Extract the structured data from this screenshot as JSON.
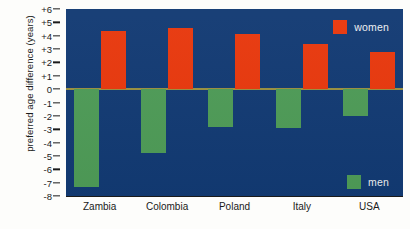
{
  "chart_data": {
    "type": "bar",
    "title": "",
    "subtitle": "",
    "xlabel": "",
    "ylabel": "preferred age difference (years)",
    "categories": [
      "Zambia",
      "Colombia",
      "Poland",
      "Italy",
      "USA"
    ],
    "series": [
      {
        "name": "women",
        "color": "#e8380d",
        "values": [
          4.35,
          4.6,
          4.1,
          3.4,
          2.8
        ]
      },
      {
        "name": "men",
        "color": "#4e9b57",
        "values": [
          -7.3,
          -4.8,
          -2.8,
          -2.9,
          -2.0
        ]
      }
    ],
    "ylim": [
      -8,
      6
    ],
    "ytick_labels": [
      "+6",
      "+5",
      "+4",
      "+3",
      "+2",
      "+1",
      "0",
      "-1",
      "-2",
      "-3",
      "-4",
      "-5",
      "-6",
      "-7",
      "-8"
    ],
    "ytick_values": [
      6,
      5,
      4,
      3,
      2,
      1,
      0,
      -1,
      -2,
      -3,
      -4,
      -5,
      -6,
      -7,
      -8
    ],
    "grid": false,
    "zero_line": true,
    "zero_line_color": "#9a9040",
    "plot_background": "#123a73",
    "legend_position": "right",
    "legend": [
      {
        "label": "women",
        "color": "#e8380d"
      },
      {
        "label": "men",
        "color": "#4e9b57"
      }
    ]
  },
  "axis": {
    "y_title": "preferred age difference (years)"
  }
}
